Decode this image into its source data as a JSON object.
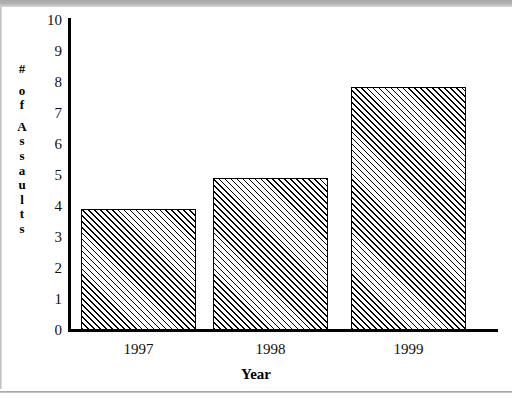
{
  "chart_data": {
    "type": "bar",
    "title": "",
    "categories": [
      "1997",
      "1998",
      "1999"
    ],
    "values": [
      3.9,
      4.9,
      7.85
    ],
    "xlabel": "Year",
    "ylabel": "# of Assaults",
    "ylim": [
      0,
      10
    ],
    "ytick_labels": [
      "10",
      "9",
      "8",
      "7",
      "6",
      "5",
      "4",
      "3",
      "2",
      "1",
      "0"
    ],
    "ytick_values": [
      10,
      9,
      8,
      7,
      6,
      5,
      4,
      3,
      2,
      1,
      0
    ],
    "grid": false,
    "legend": null,
    "series": [
      {
        "name": "# of Assaults",
        "values": [
          3.9,
          4.9,
          7.85
        ]
      }
    ],
    "bar_fill": "diagonal-hatch",
    "bar_border_color": "#000000",
    "axis_color": "#000000"
  },
  "ylabel_chars": [
    "#",
    "",
    "o",
    "f",
    "",
    "A",
    "s",
    "s",
    "a",
    "u",
    "l",
    "t",
    "s"
  ],
  "colors": {
    "axis": "#000000",
    "text": "#101010",
    "background": "#ffffff",
    "chrome_band": "#b4b4b4"
  }
}
